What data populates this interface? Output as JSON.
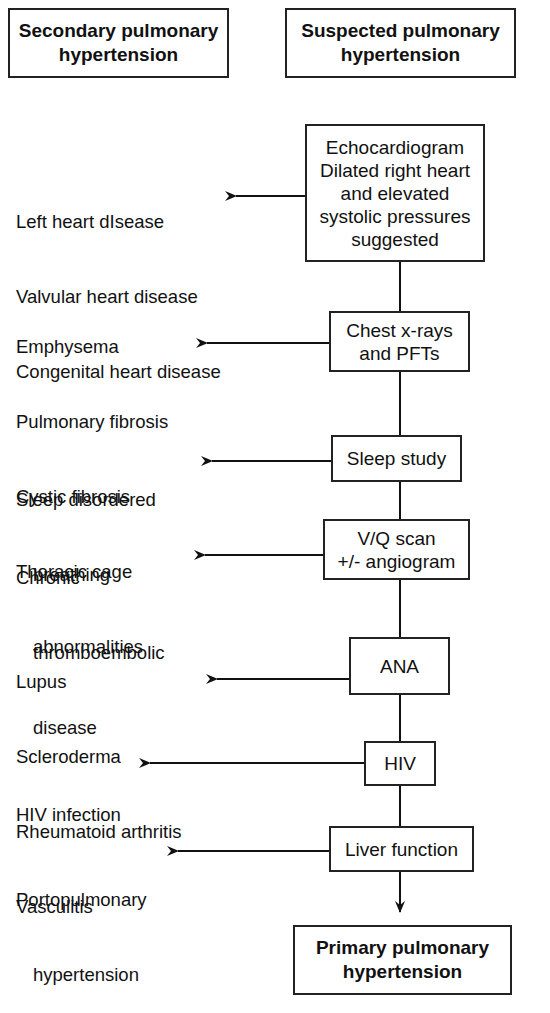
{
  "headers": {
    "left": "Secondary pulmonary\nhypertension",
    "right": "Suspected pulmonary\nhypertension"
  },
  "steps": [
    {
      "test": "Echocardiogram\nDilated right heart\nand elevated\nsystolic pressures\nsuggested",
      "findings": [
        "Left heart dIsease",
        "Valvular heart disease",
        "Congenital heart disease"
      ]
    },
    {
      "test": "Chest x-rays\nand PFTs",
      "findings": [
        "Emphysema",
        "Pulmonary fibrosis",
        "Cystic fibrosis",
        "Thoracic cage",
        "abnormalities"
      ]
    },
    {
      "test": "Sleep study",
      "findings": [
        "Sleep disordered",
        "breathing"
      ]
    },
    {
      "test": "V/Q scan\n+/- angiogram",
      "findings": [
        "Chronic",
        "thromboembolic",
        "disease"
      ]
    },
    {
      "test": "ANA",
      "findings": [
        "Lupus",
        "Scleroderma",
        "Rheumatoid arthritis",
        "Vasculitis"
      ]
    },
    {
      "test": "HIV",
      "findings": [
        "HIV infection"
      ]
    },
    {
      "test": "Liver function",
      "findings": [
        "Portopulmonary",
        "hypertension"
      ]
    }
  ],
  "outcome": "Primary pulmonary\nhypertension"
}
